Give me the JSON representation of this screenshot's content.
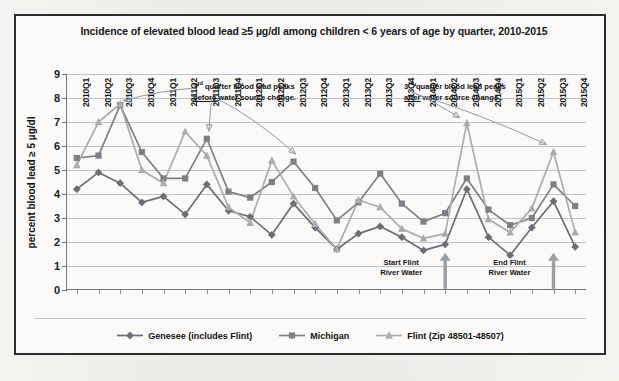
{
  "figure": {
    "title": "Incidence of elevated blood lead ≥5 µg/dl among children < 6 years of age by quarter, 2010-2015"
  },
  "annotations": {
    "before": {
      "line1_sup": "rd",
      "line1_pre": "3",
      "line1_post": " quarter  blood lead peaks",
      "line2_em": "before",
      "line2_rest": " water source change."
    },
    "after": {
      "line1_sup": "rd",
      "line1_pre": "3",
      "line1_post": " quarter blood lead peaks",
      "line2_em": "after",
      "line2_rest": " water source change ."
    },
    "start_marker": {
      "line1": "Start  Flint",
      "line2": "River Water",
      "quarter": "2014Q2"
    },
    "end_marker": {
      "line1": "End Flint",
      "line2": "River Water",
      "quarter": "2015Q3"
    }
  },
  "legend": {
    "items": [
      {
        "label": "Genesee (includes Flint)",
        "marker": "diamond",
        "color": "#6b6f75"
      },
      {
        "label": "Michigan",
        "marker": "square",
        "color": "#7d8186"
      },
      {
        "label": "Flint (Zip 48501-48507)",
        "marker": "triangle",
        "color": "#a9acb0"
      }
    ]
  },
  "chart_data": {
    "type": "line",
    "title": "Incidence of elevated blood lead ≥5 µg/dl among children < 6 years of age by quarter, 2010-2015",
    "xlabel": "",
    "ylabel": "percent blood lead ≥ 5 µg/dl",
    "ylim": [
      0,
      9
    ],
    "yticks": [
      0,
      1,
      2,
      3,
      4,
      5,
      6,
      7,
      8,
      9
    ],
    "grid": true,
    "legend_position": "bottom",
    "categories": [
      "2010Q1",
      "2010Q2",
      "2010Q3",
      "2010Q4",
      "2011Q1",
      "2011Q2",
      "2011Q3",
      "2011Q4",
      "2012Q1",
      "2012Q2",
      "2012Q3",
      "2012Q4",
      "2013Q1",
      "2013Q2",
      "2013Q3",
      "2013Q4",
      "2014Q1",
      "2014Q2",
      "2014Q3",
      "2014Q4",
      "2015Q1",
      "2015Q2",
      "2015Q3",
      "2015Q4"
    ],
    "series": [
      {
        "name": "Genesee (includes Flint)",
        "marker": "diamond",
        "color": "#6b6f75",
        "values": [
          4.2,
          4.9,
          4.45,
          3.65,
          3.9,
          3.15,
          4.4,
          3.3,
          3.05,
          2.3,
          3.6,
          2.6,
          1.7,
          2.35,
          2.65,
          2.2,
          1.65,
          1.9,
          4.2,
          2.2,
          1.45,
          2.6,
          3.7,
          1.8
        ]
      },
      {
        "name": "Michigan",
        "marker": "square",
        "color": "#7d8186",
        "values": [
          5.5,
          5.6,
          7.7,
          5.75,
          4.65,
          4.65,
          6.3,
          4.1,
          3.85,
          4.5,
          5.35,
          4.25,
          2.9,
          3.65,
          4.85,
          3.6,
          2.85,
          3.2,
          4.65,
          3.35,
          2.7,
          3.0,
          4.4,
          3.5
        ]
      },
      {
        "name": "Flint (Zip 48501-48507)",
        "marker": "triangle",
        "color": "#a9acb0",
        "values": [
          5.2,
          7.0,
          7.75,
          5.0,
          4.45,
          6.6,
          5.6,
          3.45,
          2.8,
          5.4,
          3.9,
          2.75,
          1.7,
          3.75,
          3.45,
          2.55,
          2.15,
          2.35,
          6.95,
          2.95,
          2.4,
          3.4,
          5.75,
          2.4
        ]
      }
    ]
  }
}
